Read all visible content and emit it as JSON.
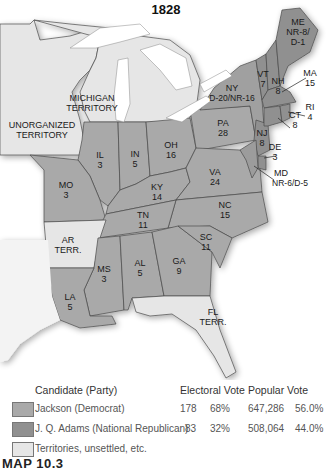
{
  "map": {
    "title": "1828",
    "colors": {
      "jackson": "#a9a9a9",
      "adams": "#909090",
      "territory": "#e6e6e6",
      "water": "#ffffff",
      "border": "#4a4a4a"
    },
    "region_labels": {
      "unorganized": [
        "UNORGANIZED",
        "TERRITORY"
      ],
      "michigan": [
        "MICHIGAN",
        "TERRITORY"
      ],
      "ar": [
        "AR",
        "TERR."
      ],
      "fl": [
        "FL",
        "TERR."
      ]
    },
    "states": [
      {
        "abbr": "ME",
        "votes": "NR-8/",
        "votes2": "D-1",
        "winner": "adams"
      },
      {
        "abbr": "VT",
        "votes": "7",
        "winner": "adams"
      },
      {
        "abbr": "NH",
        "votes": "8",
        "winner": "adams"
      },
      {
        "abbr": "MA",
        "votes": "15",
        "winner": "adams"
      },
      {
        "abbr": "RI",
        "votes": "4",
        "winner": "adams"
      },
      {
        "abbr": "CT",
        "votes": "8",
        "winner": "adams"
      },
      {
        "abbr": "NY",
        "votes": "D-20/NR-16",
        "winner": "split"
      },
      {
        "abbr": "NJ",
        "votes": "8",
        "winner": "adams"
      },
      {
        "abbr": "DE",
        "votes": "3",
        "winner": "adams"
      },
      {
        "abbr": "MD",
        "votes": "NR-6/D-5",
        "winner": "split"
      },
      {
        "abbr": "PA",
        "votes": "28",
        "winner": "jackson"
      },
      {
        "abbr": "OH",
        "votes": "16",
        "winner": "jackson"
      },
      {
        "abbr": "IN",
        "votes": "5",
        "winner": "jackson"
      },
      {
        "abbr": "IL",
        "votes": "3",
        "winner": "jackson"
      },
      {
        "abbr": "MO",
        "votes": "3",
        "winner": "jackson"
      },
      {
        "abbr": "KY",
        "votes": "14",
        "winner": "jackson"
      },
      {
        "abbr": "VA",
        "votes": "24",
        "winner": "jackson"
      },
      {
        "abbr": "NC",
        "votes": "15",
        "winner": "jackson"
      },
      {
        "abbr": "TN",
        "votes": "11",
        "winner": "jackson"
      },
      {
        "abbr": "SC",
        "votes": "11",
        "winner": "jackson"
      },
      {
        "abbr": "GA",
        "votes": "9",
        "winner": "jackson"
      },
      {
        "abbr": "AL",
        "votes": "5",
        "winner": "jackson"
      },
      {
        "abbr": "MS",
        "votes": "3",
        "winner": "jackson"
      },
      {
        "abbr": "LA",
        "votes": "5",
        "winner": "jackson"
      }
    ]
  },
  "legend": {
    "headers": {
      "candidate": "Candidate (Party)",
      "electoral": "Electoral Vote",
      "popular": "Popular Vote"
    },
    "rows": [
      {
        "candidate": "Jackson (Democrat)",
        "ev": "178",
        "ev_pct": "68%",
        "pv": "647,286",
        "pv_pct": "56.0%"
      },
      {
        "candidate": "J. Q. Adams (National Republican)",
        "ev": "83",
        "ev_pct": "32%",
        "pv": "508,064",
        "pv_pct": "44.0%"
      },
      {
        "candidate": "Territories, unsettled, etc.",
        "ev": "",
        "ev_pct": "",
        "pv": "",
        "pv_pct": ""
      }
    ]
  },
  "caption": "MAP 10.3"
}
